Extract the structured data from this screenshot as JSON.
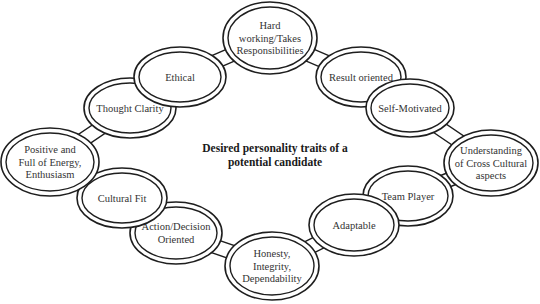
{
  "diagram": {
    "title_lines": [
      "Desired personality traits of a",
      "potential candidate"
    ],
    "colors": {
      "stroke": "#1e1e1e",
      "text": "#333333",
      "background": "#ffffff"
    },
    "nodes": [
      {
        "id": "hard-working",
        "lines": [
          "Hard",
          "working/Takes",
          "Responsibilities"
        ],
        "cx": 270,
        "cy": 38,
        "rx": 47,
        "ry": 36
      },
      {
        "id": "result-oriented",
        "lines": [
          "Result oriented"
        ],
        "cx": 361,
        "cy": 77,
        "rx": 45,
        "ry": 30
      },
      {
        "id": "self-motivated",
        "lines": [
          "Self-Motivated"
        ],
        "cx": 410,
        "cy": 108,
        "rx": 44,
        "ry": 29
      },
      {
        "id": "understanding-cross-cultural",
        "lines": [
          "Understanding",
          "of Cross Cultural",
          "aspects"
        ],
        "cx": 491,
        "cy": 163,
        "rx": 47,
        "ry": 33
      },
      {
        "id": "team-player",
        "lines": [
          "Team Player"
        ],
        "cx": 408,
        "cy": 196,
        "rx": 45,
        "ry": 30
      },
      {
        "id": "adaptable",
        "lines": [
          "Adaptable"
        ],
        "cx": 354,
        "cy": 225,
        "rx": 45,
        "ry": 31
      },
      {
        "id": "honesty",
        "lines": [
          "Honesty,",
          "Integrity,",
          "Dependability"
        ],
        "cx": 272,
        "cy": 266,
        "rx": 47,
        "ry": 34
      },
      {
        "id": "action-decision",
        "lines": [
          "Action/Decision",
          "Oriented"
        ],
        "cx": 176,
        "cy": 233,
        "rx": 46,
        "ry": 31
      },
      {
        "id": "cultural-fit",
        "lines": [
          "Cultural Fit"
        ],
        "cx": 122,
        "cy": 198,
        "rx": 45,
        "ry": 30
      },
      {
        "id": "positive-energy",
        "lines": [
          "Positive and",
          "Full of Energy,",
          "Enthusiasm"
        ],
        "cx": 50,
        "cy": 162,
        "rx": 49,
        "ry": 34
      },
      {
        "id": "thought-clarity",
        "lines": [
          "Thought Clarity"
        ],
        "cx": 130,
        "cy": 108,
        "rx": 46,
        "ry": 30
      },
      {
        "id": "ethical",
        "lines": [
          "Ethical"
        ],
        "cx": 180,
        "cy": 77,
        "rx": 46,
        "ry": 30
      }
    ]
  }
}
